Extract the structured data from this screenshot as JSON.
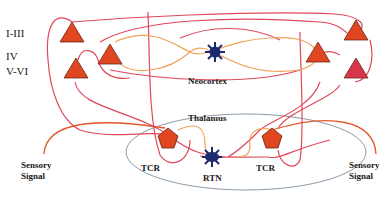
{
  "diagram": {
    "type": "thalamocortical-circuit",
    "layers": [
      {
        "id": "l1-3",
        "label": "I-III"
      },
      {
        "id": "l4",
        "label": "IV"
      },
      {
        "id": "l5-6",
        "label": "V-VI"
      }
    ],
    "regions": {
      "neocortex": "Neocortex",
      "thalamus": "Thalamus"
    },
    "cells": {
      "tcr_left": "TCR",
      "tcr_right": "TCR",
      "rtn": "RTN"
    },
    "inputs": {
      "left": {
        "line1": "Sensory",
        "line2": "Signal"
      },
      "right": {
        "line1": "Sensory",
        "line2": "Signal"
      }
    },
    "colors": {
      "pyramidal": "#e0461f",
      "pyramidal_deep_right": "#d8344a",
      "pyramidal_outline": "#6b2a1a",
      "interneuron": "#1c2a6e",
      "excitatory_path": "#e0475a",
      "inhibitory_path": "#f0a25a",
      "thalamus_border": "#8a9aa8",
      "sensory_path": "#e3572c"
    }
  }
}
